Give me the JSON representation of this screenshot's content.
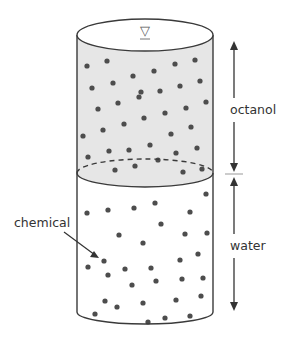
{
  "diagram": {
    "labels": {
      "octanol": "octanol",
      "water": "water",
      "chemical": "chemical"
    },
    "symbols": {
      "surface_marker": "▽"
    },
    "colors": {
      "octanol_fill": "#e6e6e6",
      "water_fill": "#ffffff",
      "outline": "#3a3a3a",
      "dot": "#4d4d4d",
      "text": "#333333"
    },
    "octanol_dots": [
      [
        87,
        66
      ],
      [
        107,
        61
      ],
      [
        133,
        76
      ],
      [
        154,
        71
      ],
      [
        175,
        64
      ],
      [
        195,
        60
      ],
      [
        92,
        88
      ],
      [
        113,
        83
      ],
      [
        141,
        92
      ],
      [
        160,
        91
      ],
      [
        180,
        86
      ],
      [
        200,
        81
      ],
      [
        98,
        109
      ],
      [
        118,
        103
      ],
      [
        139,
        97
      ],
      [
        165,
        113
      ],
      [
        186,
        108
      ],
      [
        206,
        102
      ],
      [
        144,
        118
      ],
      [
        124,
        124
      ],
      [
        103,
        130
      ],
      [
        83,
        136
      ],
      [
        171,
        134
      ],
      [
        191,
        127
      ],
      [
        150,
        145
      ],
      [
        129,
        150
      ],
      [
        109,
        151
      ],
      [
        197,
        148
      ],
      [
        176,
        153
      ],
      [
        88,
        157
      ],
      [
        115,
        170
      ],
      [
        135,
        166
      ],
      [
        158,
        160
      ],
      [
        183,
        172
      ],
      [
        202,
        169
      ]
    ],
    "water_dots": [
      [
        206,
        194
      ],
      [
        87,
        213
      ],
      [
        108,
        210
      ],
      [
        134,
        208
      ],
      [
        155,
        203
      ],
      [
        190,
        212
      ],
      [
        161,
        224
      ],
      [
        119,
        235
      ],
      [
        185,
        234
      ],
      [
        207,
        233
      ],
      [
        143,
        243
      ],
      [
        104,
        261
      ],
      [
        180,
        260
      ],
      [
        198,
        254
      ],
      [
        125,
        269
      ],
      [
        151,
        268
      ],
      [
        88,
        267
      ],
      [
        108,
        275
      ],
      [
        132,
        285
      ],
      [
        156,
        281
      ],
      [
        182,
        279
      ],
      [
        203,
        278
      ],
      [
        105,
        301
      ],
      [
        143,
        303
      ],
      [
        176,
        300
      ],
      [
        201,
        296
      ],
      [
        117,
        307
      ],
      [
        190,
        316
      ],
      [
        95,
        314
      ],
      [
        165,
        318
      ],
      [
        148,
        322
      ]
    ]
  }
}
